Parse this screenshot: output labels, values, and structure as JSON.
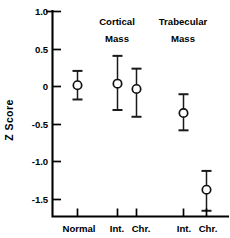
{
  "chart_data": {
    "type": "scatter",
    "title": "",
    "subtitle": "",
    "xlabel": "",
    "ylabel": "Z Score",
    "ylim": [
      -1.75,
      1.0
    ],
    "yticks": [
      1.0,
      0.5,
      0,
      -0.5,
      -1.0,
      -1.5
    ],
    "ytick_labels": [
      "1.0",
      "0.5",
      "0",
      "-0.5",
      "-1.0",
      "-1.5"
    ],
    "grid": false,
    "legend": "none",
    "error_bars": "vertical",
    "marker": "open-circle",
    "group_headers": [
      {
        "line1": "Cortical",
        "line2": "Mass"
      },
      {
        "line1": "Trabecular",
        "line2": "Mass"
      }
    ],
    "categories": [
      "Normal",
      "Int. Chr.",
      "Int. Chr."
    ],
    "xtick_labels": [
      "Normal",
      "Int.",
      "Chr.",
      "Int.",
      "Chr."
    ],
    "points": [
      {
        "label": "Normal",
        "group": "",
        "x": 77,
        "value": 0.02,
        "err_low": -0.17,
        "err_high": 0.21
      },
      {
        "label": "Int.",
        "group": "Cortical Mass",
        "x": 117,
        "value": 0.04,
        "err_low": -0.31,
        "err_high": 0.41
      },
      {
        "label": "Chr.",
        "group": "Cortical Mass",
        "x": 136,
        "value": -0.03,
        "err_low": -0.4,
        "err_high": 0.24
      },
      {
        "label": "Int.",
        "group": "Trabecular Mass",
        "x": 183,
        "value": -0.35,
        "err_low": -0.58,
        "err_high": -0.1
      },
      {
        "label": "Chr.",
        "group": "Trabecular Mass",
        "x": 206,
        "value": -1.37,
        "err_low": -1.65,
        "err_high": -1.12
      }
    ],
    "colors": {
      "axis": "#000000",
      "marker_fill": "#ffffff",
      "marker_stroke": "#111111",
      "error_bar": "#1a1a1a",
      "background": "#ffffff"
    }
  },
  "axis": {
    "ylabel": "Z Score",
    "ytick_0": "1.0",
    "ytick_1": "0.5",
    "ytick_2": "0",
    "ytick_3": "-0.5",
    "ytick_4": "-1.0",
    "ytick_5": "-1.5",
    "xtick_0": "Normal",
    "xtick_1": "Int.",
    "xtick_2": "Chr.",
    "xtick_3": "Int.",
    "xtick_4": "Chr."
  },
  "headers": {
    "cortical_line1": "Cortical",
    "cortical_line2": "Mass",
    "trabecular_line1": "Trabecular",
    "trabecular_line2": "Mass"
  }
}
